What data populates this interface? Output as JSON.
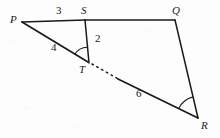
{
  "figure": {
    "type": "geometry-diagram",
    "stroke_color": "#1a1a1a",
    "background_color": "#fdfdfd",
    "vertices": [
      {
        "id": "P",
        "label": "P",
        "x": 22,
        "y": 22,
        "label_x": 10,
        "label_y": 14
      },
      {
        "id": "S",
        "label": "S",
        "x": 85,
        "y": 20,
        "label_x": 81,
        "label_y": 5
      },
      {
        "id": "Q",
        "label": "Q",
        "x": 175,
        "y": 20,
        "label_x": 172,
        "label_y": 5
      },
      {
        "id": "T",
        "label": "T",
        "x": 88,
        "y": 62,
        "label_x": 79,
        "label_y": 64
      },
      {
        "id": "R",
        "label": "R",
        "x": 198,
        "y": 118,
        "label_x": 201,
        "label_y": 120
      }
    ],
    "segments": [
      {
        "id": "PS",
        "from": "P",
        "to": "S",
        "style": "solid"
      },
      {
        "id": "SQ",
        "from": "S",
        "to": "Q",
        "style": "solid"
      },
      {
        "id": "PT",
        "from": "P",
        "to": "T",
        "style": "solid"
      },
      {
        "id": "TR",
        "from": "T",
        "to": "R",
        "style": "solid-with-dash-gap"
      },
      {
        "id": "ST",
        "from": "S",
        "to": "T",
        "style": "solid"
      },
      {
        "id": "QR",
        "from": "Q",
        "to": "R",
        "style": "solid"
      }
    ],
    "measure_labels": [
      {
        "id": "len-PS",
        "text": "3",
        "on_segment": "PS",
        "x": 56,
        "y": 5
      },
      {
        "id": "len-PT",
        "text": "4",
        "on_segment": "PT",
        "x": 51,
        "y": 42
      },
      {
        "id": "len-ST",
        "text": "2",
        "on_segment": "ST",
        "x": 95,
        "y": 33
      },
      {
        "id": "len-TR",
        "text": "6",
        "on_segment": "TR",
        "x": 136,
        "y": 88
      }
    ],
    "angle_marks": [
      {
        "id": "angle-T",
        "at": "T",
        "between": [
          "TS",
          "TP"
        ]
      },
      {
        "id": "angle-R",
        "at": "R",
        "between": [
          "RT",
          "RQ"
        ]
      }
    ]
  }
}
